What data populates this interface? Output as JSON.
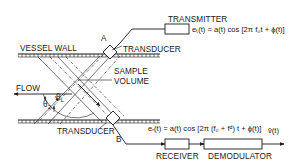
{
  "figure": {
    "labels": {
      "transmitter": "TRANSMITTER",
      "vessel_wall": "VESSEL WALL",
      "transducer_top": "TRANSDUCER",
      "transducer_bottom": "TRANSDUCER",
      "sample_volume_line1": "SAMPLE",
      "sample_volume_line2": "VOLUME",
      "flow": "FLOW",
      "point_a": "A",
      "point_b": "B",
      "receiver": "RECEIVER",
      "demodulator": "DEMODULATOR",
      "theta_2": "θ",
      "theta_2_sub": "2",
      "theta_l": "θ",
      "theta_l_sub": "L"
    },
    "equations": {
      "transmitted": "eₜ(t) = a(t) cos [2π f₀t + ϕ(t)]",
      "received": "eᵣ(t) = a(t) cos [2π (f₀ + fᵈ) t + ϕ(t)]",
      "output": "v̂(t)"
    },
    "blocks": [
      {
        "id": "transmitter",
        "label": "TRANSMITTER"
      },
      {
        "id": "receiver",
        "label": "RECEIVER"
      },
      {
        "id": "demodulator",
        "label": "DEMODULATOR"
      }
    ],
    "signal_flow": [
      "TRANSMITTER -> TRANSDUCER A",
      "TRANSDUCER B -> RECEIVER",
      "RECEIVER -> DEMODULATOR",
      "DEMODULATOR -> v̂(t)"
    ]
  }
}
